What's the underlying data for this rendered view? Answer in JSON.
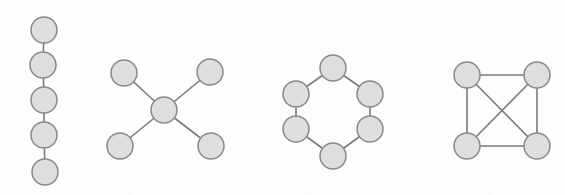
{
  "figure": {
    "background_color": "#fdfdfd",
    "node_fill_color": "#dedede",
    "node_stroke_color": "#8a8a8a",
    "edge_color": "#7a7a7a",
    "node_radius": 13,
    "edge_stroke_width": 1.6,
    "node_stroke_width": 1.5,
    "width": 565,
    "height": 195
  },
  "chart_data": {
    "type": "diagram",
    "subtype": "graph-node-link",
    "title": "",
    "xlabel": "",
    "ylabel": "",
    "graphs": [
      {
        "name": "path-graph",
        "label": "",
        "node_count": 5,
        "edge_count": 4,
        "nodes": [
          {
            "id": "p1",
            "x": 44,
            "y": 30
          },
          {
            "id": "p2",
            "x": 43,
            "y": 65
          },
          {
            "id": "p3",
            "x": 44,
            "y": 100
          },
          {
            "id": "p4",
            "x": 44,
            "y": 135
          },
          {
            "id": "p5",
            "x": 45,
            "y": 172
          }
        ],
        "edges": [
          {
            "source": "p1",
            "target": "p2"
          },
          {
            "source": "p2",
            "target": "p3"
          },
          {
            "source": "p3",
            "target": "p4"
          },
          {
            "source": "p4",
            "target": "p5"
          }
        ]
      },
      {
        "name": "star-graph",
        "label": "",
        "node_count": 5,
        "edge_count": 4,
        "nodes": [
          {
            "id": "s0",
            "x": 164,
            "y": 110
          },
          {
            "id": "s1",
            "x": 124,
            "y": 73
          },
          {
            "id": "s2",
            "x": 210,
            "y": 72
          },
          {
            "id": "s3",
            "x": 120,
            "y": 146
          },
          {
            "id": "s4",
            "x": 211,
            "y": 146
          }
        ],
        "edges": [
          {
            "source": "s0",
            "target": "s1"
          },
          {
            "source": "s0",
            "target": "s2"
          },
          {
            "source": "s0",
            "target": "s3"
          },
          {
            "source": "s0",
            "target": "s4"
          }
        ]
      },
      {
        "name": "cycle-graph",
        "label": "",
        "node_count": 6,
        "edge_count": 6,
        "nodes": [
          {
            "id": "c1",
            "x": 333,
            "y": 68
          },
          {
            "id": "c2",
            "x": 370,
            "y": 94
          },
          {
            "id": "c3",
            "x": 370,
            "y": 129
          },
          {
            "id": "c4",
            "x": 333,
            "y": 156
          },
          {
            "id": "c5",
            "x": 296,
            "y": 129
          },
          {
            "id": "c6",
            "x": 296,
            "y": 94
          }
        ],
        "edges": [
          {
            "source": "c1",
            "target": "c2"
          },
          {
            "source": "c2",
            "target": "c3"
          },
          {
            "source": "c3",
            "target": "c4"
          },
          {
            "source": "c4",
            "target": "c5"
          },
          {
            "source": "c5",
            "target": "c6"
          },
          {
            "source": "c6",
            "target": "c1"
          }
        ]
      },
      {
        "name": "complete-graph-k4",
        "label": "",
        "node_count": 4,
        "edge_count": 6,
        "nodes": [
          {
            "id": "k1",
            "x": 467,
            "y": 75
          },
          {
            "id": "k2",
            "x": 537,
            "y": 75
          },
          {
            "id": "k3",
            "x": 537,
            "y": 146
          },
          {
            "id": "k4",
            "x": 467,
            "y": 146
          }
        ],
        "edges": [
          {
            "source": "k1",
            "target": "k2"
          },
          {
            "source": "k2",
            "target": "k3"
          },
          {
            "source": "k3",
            "target": "k4"
          },
          {
            "source": "k4",
            "target": "k1"
          },
          {
            "source": "k1",
            "target": "k3"
          },
          {
            "source": "k2",
            "target": "k4"
          }
        ]
      }
    ]
  }
}
